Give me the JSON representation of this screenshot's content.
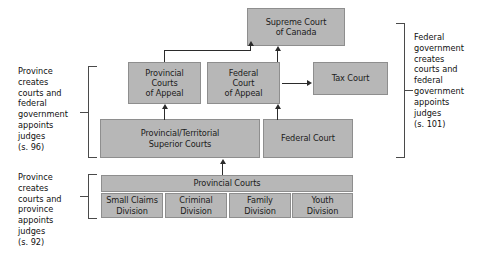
{
  "diagram": {
    "box_fill_color": "#b7b7b7",
    "box_border_color": "#8e8e8e",
    "connector_color": "#2b2b2b",
    "text_color": "#1b1b1b",
    "background_color": "#ffffff"
  },
  "courts": {
    "supreme": "Supreme Court\nof Canada",
    "provincial_appeal": "Provincial\nCourts\nof Appeal",
    "federal_appeal": "Federal\nCourt\nof Appeal",
    "tax": "Tax Court",
    "superior": "Provincial/Territorial\nSuperior Courts",
    "federal": "Federal Court",
    "provincial": "Provincial Courts"
  },
  "divisions": [
    {
      "label": "Small Claims\nDivision"
    },
    {
      "label": "Criminal\nDivision"
    },
    {
      "label": "Family\nDivision"
    },
    {
      "label": "Youth\nDivision"
    }
  ],
  "annotations": {
    "left_s96": "Province\ncreates\ncourts and\nfederal\ngovernment\nappoints\njudges\n(s. 96)",
    "left_s92": "Province\ncreates\ncourts and\nprovince\nappoints\njudges\n(s. 92)",
    "right_s101": "Federal\ngovernment\ncreates\ncourts and\nfederal\ngovernment\nappoints\njudges\n(s. 101)"
  }
}
